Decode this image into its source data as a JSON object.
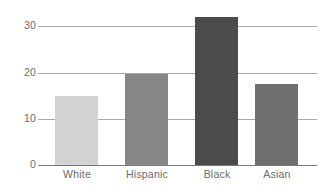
{
  "chart_data": {
    "type": "bar",
    "title": "",
    "subtitle": "",
    "xlabel": "",
    "ylabel": "",
    "categories": [
      "White",
      "Hispanic",
      "Black",
      "Asian"
    ],
    "values": [
      14.8,
      19.5,
      31.8,
      17.4
    ],
    "series": [
      {
        "name": "",
        "values": [
          14.8,
          19.5,
          31.8,
          17.4
        ]
      }
    ],
    "ylim": [
      0,
      34
    ],
    "yticks": [
      0,
      10,
      20,
      30
    ],
    "ytick_labels": [
      "0",
      "10",
      "20",
      "30"
    ],
    "grid": true,
    "grid_axis": "y",
    "legend": false,
    "legend_position": "none",
    "bar_colors": [
      "#d2d2d2",
      "#878787",
      "#4b4b4b",
      "#6f6f6f"
    ],
    "gridline_color": "#a8a8a8",
    "baseline_color": "#7a7a7a",
    "label_color": "#6a6a6a",
    "background_color": "#ffffff"
  }
}
